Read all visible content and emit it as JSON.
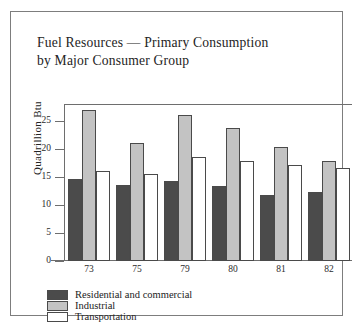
{
  "figure": {
    "title_line1": "Fuel Resources — Primary Consumption",
    "title_line2": "by Major Consumer Group"
  },
  "chart_data": {
    "type": "bar",
    "title": "Fuel Resources — Primary Consumption by Major Consumer Group",
    "xlabel": "",
    "ylabel": "Quadrillion Btu",
    "categories": [
      "73",
      "75",
      "79",
      "80",
      "81",
      "82"
    ],
    "yticks": [
      0,
      5,
      10,
      15,
      20,
      25
    ],
    "ylim": [
      0,
      28
    ],
    "grid": false,
    "legend_position": "below-axes-left",
    "series": [
      {
        "name": "Residential and commercial",
        "color": "#4b4b4b",
        "values": [
          14.7,
          13.6,
          14.3,
          13.3,
          11.7,
          12.3
        ]
      },
      {
        "name": "Industrial",
        "color": "#c3c3c3",
        "values": [
          27.0,
          21.0,
          26.0,
          23.8,
          20.3,
          17.8
        ]
      },
      {
        "name": "Transportation",
        "color": "#ffffff",
        "values": [
          16.0,
          15.6,
          18.6,
          17.8,
          17.2,
          16.5
        ]
      }
    ]
  }
}
